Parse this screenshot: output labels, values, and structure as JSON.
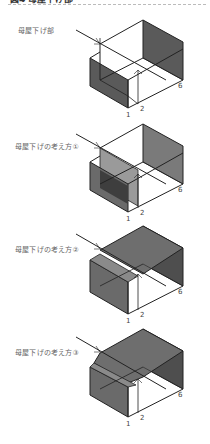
{
  "header": {
    "title": "図4 母屋下げ部"
  },
  "figures": [
    {
      "label": "母屋下げ部",
      "numbers": [
        "1",
        "2",
        "6"
      ],
      "variant": "base"
    },
    {
      "label": "母屋下げの考え方①",
      "numbers": [
        "1",
        "2",
        "6"
      ],
      "variant": "approach-1"
    },
    {
      "label": "母屋下げの考え方②",
      "numbers": [
        "1",
        "2",
        "6",
        "1"
      ],
      "variant": "approach-2"
    },
    {
      "label": "母屋下げの考え方③",
      "numbers": [
        "1",
        "2",
        "6",
        "1"
      ],
      "variant": "approach-3"
    }
  ],
  "colors": {
    "line": "#222222",
    "shade_dark": "#5a5a5a",
    "shade_mid": "#7a7a7a",
    "shade_light": "#9a9a9a",
    "label": "#666666",
    "rule": "#bbbbbb"
  }
}
